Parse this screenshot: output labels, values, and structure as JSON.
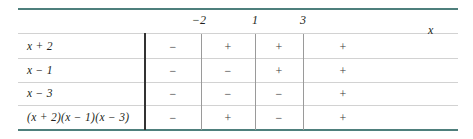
{
  "chart_data": {
    "type": "table",
    "title": "",
    "xlabel": "x",
    "critical_points": [
      "−2",
      "1",
      "3"
    ],
    "row_header": "",
    "rows": [
      {
        "factor": "x + 2",
        "signs": [
          "−",
          "+",
          "+",
          "+"
        ]
      },
      {
        "factor": "x − 1",
        "signs": [
          "−",
          "−",
          "+",
          "+"
        ]
      },
      {
        "factor": "x − 3",
        "signs": [
          "−",
          "−",
          "−",
          "+"
        ]
      },
      {
        "factor": "(x + 2)(x − 1)(x − 3)",
        "signs": [
          "−",
          "+",
          "−",
          "+"
        ]
      }
    ],
    "intervals": [
      "(−∞, −2)",
      "(−2, 1)",
      "(1, 3)",
      "(3, ∞)"
    ],
    "colors": {
      "border_accent": "#4e7f7c",
      "grid_line": "#d2d2d2",
      "divider": "#9a9a9a",
      "main_divider": "#333333",
      "text": "#231f20"
    }
  }
}
